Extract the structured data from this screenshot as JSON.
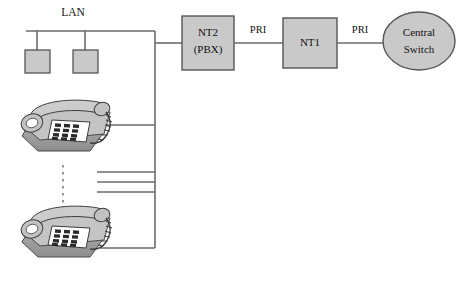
{
  "diagram": {
    "background_color": "#ffffff",
    "line_color": "#6b6b6b",
    "shape_fill": "#c9c9c9",
    "shape_stroke": "#555555",
    "text_color": "#111111",
    "phone_body_color": "#b9b9b9",
    "phone_keypad_color": "#ffffff",
    "phone_key_color": "#2a2a2a"
  },
  "lan": {
    "label": "LAN",
    "terminals": [
      {
        "name": "lan-terminal-1"
      },
      {
        "name": "lan-terminal-2"
      }
    ]
  },
  "nodes": {
    "pbx": {
      "line1": "NT2",
      "line2": "(PBX)"
    },
    "nt1": {
      "label": "NT1"
    },
    "central_switch": {
      "line1": "Central",
      "line2": "Switch"
    }
  },
  "links": [
    {
      "name": "pbx-to-nt1",
      "label": "PRI"
    },
    {
      "name": "nt1-to-central-switch",
      "label": "PRI"
    }
  ],
  "phones": [
    {
      "name": "telephone-top"
    },
    {
      "name": "telephone-bottom"
    }
  ],
  "ellipsis": {
    "name": "vertical-ellipsis",
    "symbol": "⋮"
  }
}
